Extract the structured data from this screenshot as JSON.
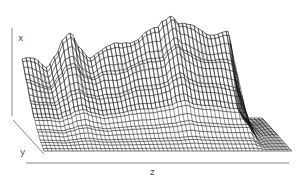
{
  "chart_data": {
    "type": "surface-wireframe",
    "title": "",
    "xlabel": "x",
    "ylabel": "y",
    "zlabel": "z",
    "grid": false,
    "legend": null,
    "color": "#111111",
    "axis_color": "#888888",
    "label_color": "#555555",
    "z_range": [
      0,
      1
    ],
    "y_range": [
      0,
      1
    ],
    "x_range": [
      0,
      1
    ],
    "back_ridge_profile": {
      "z": [
        0.0,
        0.05,
        0.1,
        0.14,
        0.17,
        0.2,
        0.24,
        0.28,
        0.32,
        0.36,
        0.4,
        0.44,
        0.48,
        0.52,
        0.56,
        0.59,
        0.62,
        0.66,
        0.7,
        0.74,
        0.78,
        0.82,
        0.86,
        0.88,
        0.9,
        0.93,
        1.0
      ],
      "height": [
        0.56,
        0.54,
        0.5,
        0.62,
        0.74,
        0.78,
        0.66,
        0.6,
        0.64,
        0.66,
        0.7,
        0.74,
        0.76,
        0.8,
        0.84,
        0.94,
        1.0,
        0.9,
        0.86,
        0.84,
        0.82,
        0.81,
        0.8,
        0.4,
        0.08,
        0.02,
        0.0
      ]
    },
    "depth_decay": {
      "y": [
        0.0,
        0.2,
        0.4,
        0.55,
        0.7,
        0.85,
        1.0
      ],
      "factor": [
        1.0,
        0.72,
        0.48,
        0.32,
        0.18,
        0.07,
        0.0
      ]
    },
    "mesh": {
      "columns_along_z": 60,
      "rows_along_y": 22
    }
  }
}
